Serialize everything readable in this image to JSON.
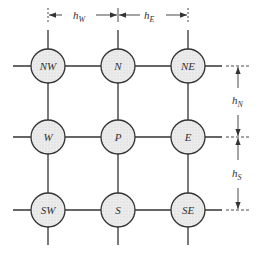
{
  "diagram": {
    "nodes": [
      {
        "id": "NW",
        "label": "NW",
        "cx": 48,
        "cy": 66
      },
      {
        "id": "N",
        "label": "N",
        "cx": 118,
        "cy": 66
      },
      {
        "id": "NE",
        "label": "NE",
        "cx": 188,
        "cy": 66
      },
      {
        "id": "W",
        "label": "W",
        "cx": 48,
        "cy": 137
      },
      {
        "id": "P",
        "label": "P",
        "cx": 118,
        "cy": 137
      },
      {
        "id": "E",
        "label": "E",
        "cx": 188,
        "cy": 137
      },
      {
        "id": "SW",
        "label": "SW",
        "cx": 48,
        "cy": 210
      },
      {
        "id": "S",
        "label": "S",
        "cx": 118,
        "cy": 210
      },
      {
        "id": "SE",
        "label": "SE",
        "cx": 188,
        "cy": 210
      }
    ],
    "dimensions": {
      "hW": {
        "main": "h",
        "sub": "W"
      },
      "hE": {
        "main": "h",
        "sub": "E"
      },
      "hN": {
        "main": "h",
        "sub": "N"
      },
      "hS": {
        "main": "h",
        "sub": "S"
      }
    },
    "colors": {
      "line": "#333333",
      "fill": "#e8e8e8"
    }
  }
}
